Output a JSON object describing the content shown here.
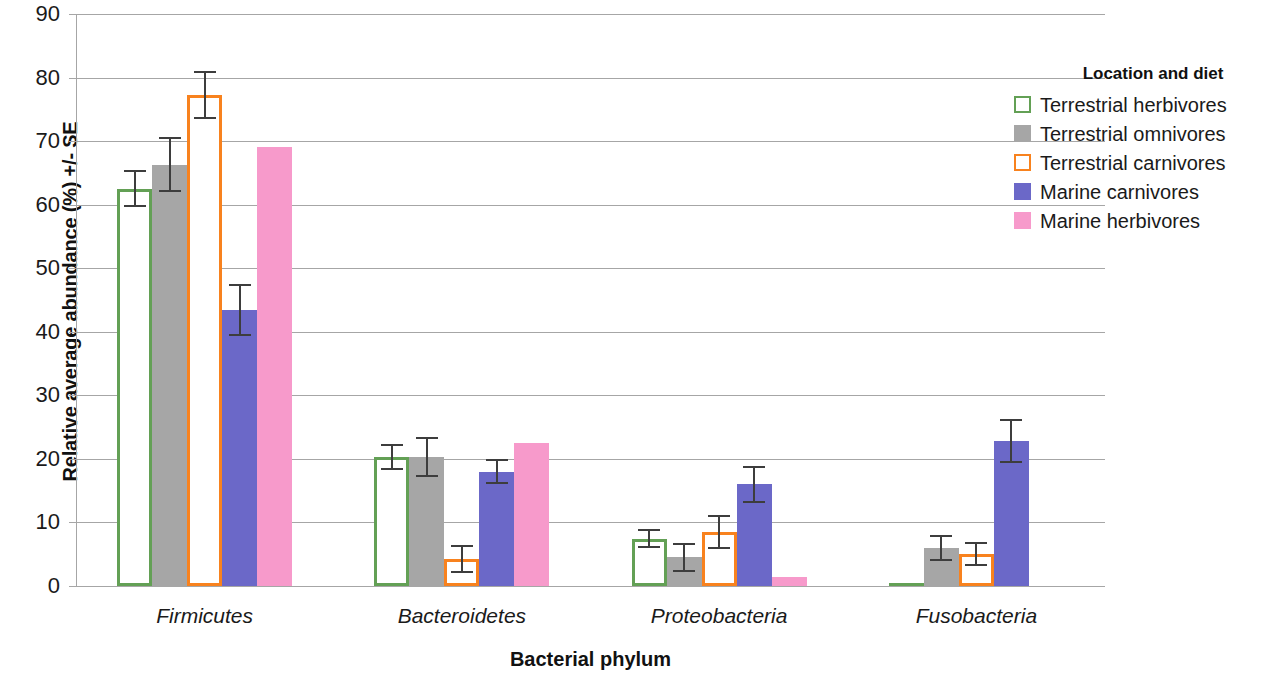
{
  "chart_data": {
    "type": "bar",
    "title": "",
    "xlabel": "Bacterial phylum",
    "ylabel": "Relative average abundance (%) +/- SE",
    "ylim": [
      0,
      90
    ],
    "yticks": [
      0,
      10,
      20,
      30,
      40,
      50,
      60,
      70,
      80,
      90
    ],
    "grid": true,
    "legend_position": "right",
    "legend_title": "Location and diet",
    "categories": [
      "Firmicutes",
      "Bacteroidetes",
      "Proteobacteria",
      "Fusobacteria"
    ],
    "series": [
      {
        "name": "Terrestrial herbivores",
        "style": "outline",
        "color": "#63A055",
        "values": [
          62.5,
          20.3,
          7.4,
          0.5
        ],
        "errors": [
          2.9,
          2.1,
          1.5,
          0.0
        ]
      },
      {
        "name": "Terrestrial omnivores",
        "style": "filled",
        "color": "#A6A6A6",
        "values": [
          66.3,
          20.3,
          4.5,
          6.0
        ],
        "errors": [
          4.3,
          3.1,
          2.3,
          2.0
        ]
      },
      {
        "name": "Terrestrial carnivores",
        "style": "outline",
        "color": "#F8821E",
        "values": [
          77.2,
          4.3,
          8.5,
          5.0
        ],
        "errors": [
          3.8,
          2.2,
          2.6,
          1.9
        ]
      },
      {
        "name": "Marine carnivores",
        "style": "filled",
        "color": "#6B68C8",
        "values": [
          43.4,
          18.0,
          16.0,
          22.8
        ],
        "errors": [
          4.1,
          2.0,
          2.9,
          3.5
        ]
      },
      {
        "name": "Marine herbivores",
        "style": "filled",
        "color": "#F79ACB",
        "values": [
          69.0,
          22.5,
          1.4,
          0.0
        ],
        "errors": [
          0.0,
          0.0,
          0.0,
          0.0
        ]
      }
    ]
  },
  "axis": {
    "y_title": "Relative average abundance (%) +/- SE",
    "x_title": "Bacterial phylum",
    "y_tick_labels": [
      "90",
      "80",
      "70",
      "60",
      "50",
      "40",
      "30",
      "20",
      "10",
      "0"
    ]
  },
  "legend": {
    "title": "Location and diet",
    "items": [
      {
        "label": "Terrestrial herbivores",
        "color": "#63A055",
        "style": "outline"
      },
      {
        "label": "Terrestrial omnivores",
        "color": "#A6A6A6",
        "style": "filled"
      },
      {
        "label": "Terrestrial carnivores",
        "color": "#F8821E",
        "style": "outline"
      },
      {
        "label": "Marine carnivores",
        "color": "#6B68C8",
        "style": "filled"
      },
      {
        "label": "Marine herbivores",
        "color": "#F79ACB",
        "style": "filled"
      }
    ]
  }
}
